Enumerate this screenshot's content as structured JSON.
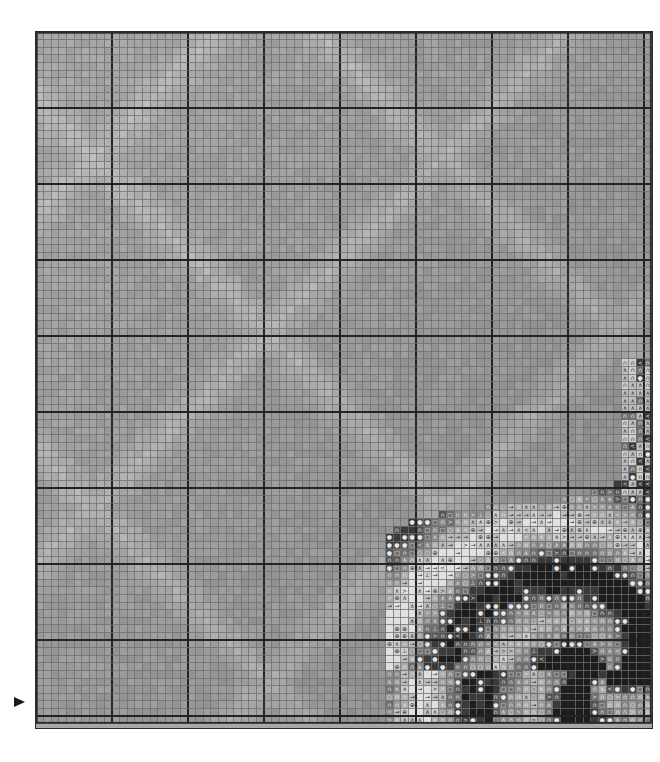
{
  "chart_data": {
    "type": "heatmap",
    "grid": {
      "columns": 81,
      "rows": 91,
      "cell_px": 7.6,
      "bold_every": 10
    },
    "xlabel": "",
    "ylabel": "",
    "grid_on": true,
    "legend_position": "none",
    "colors": {
      "background": "#a8a8a8",
      "grid_minor": "#6e6e6e",
      "grid_major": "#232323",
      "border": "#2b2b2b",
      "marker": "#1a1a1a",
      "page": "#ffffff"
    },
    "palette": [
      {
        "key": "g0",
        "hex": "#f2f2f2",
        "name": "near-white"
      },
      {
        "key": "g1",
        "hex": "#e0e0e0",
        "name": "light-1"
      },
      {
        "key": "g2",
        "hex": "#cfcfcf",
        "name": "light-2"
      },
      {
        "key": "g3",
        "hex": "#bdbdbd",
        "name": "light-3"
      },
      {
        "key": "g4",
        "hex": "#ababab",
        "name": "mid-1"
      },
      {
        "key": "g5",
        "hex": "#9b9b9b",
        "name": "mid-2"
      },
      {
        "key": "g6",
        "hex": "#8a8a8a",
        "name": "mid-3"
      },
      {
        "key": "g7",
        "hex": "#6f6f6f",
        "name": "dark-1"
      },
      {
        "key": "g8",
        "hex": "#545454",
        "name": "dark-2"
      },
      {
        "key": "g9",
        "hex": "#3a3a3a",
        "name": "dark-3"
      },
      {
        "key": "ga",
        "hex": "#1d1d1d",
        "name": "near-black"
      }
    ],
    "symbols": [
      {
        "key": "n",
        "glyph": "∩",
        "name": "arch"
      },
      {
        "key": "a",
        "glyph": "∧",
        "name": "caret"
      },
      {
        "key": "o",
        "glyph": "○",
        "name": "circle"
      },
      {
        "key": "q",
        "glyph": "□",
        "name": "square"
      },
      {
        "key": "d",
        "glyph": "●",
        "name": "filled-circle"
      },
      {
        "key": "g",
        "glyph": ">",
        "name": "greater-than"
      },
      {
        "key": "l",
        "glyph": "<",
        "name": "less-than"
      },
      {
        "key": "r",
        "glyph": "→",
        "name": "right-arrow"
      },
      {
        "key": "p",
        "glyph": "⊕",
        "name": "circled-plus"
      },
      {
        "key": "t",
        "glyph": "⊥",
        "name": "up-tack"
      }
    ],
    "center_marker": {
      "edge": "left",
      "row": 88,
      "glyph": "▶",
      "name": "row-center-marker"
    },
    "symbol_region": {
      "note": "Symbols occupy the lower-right quadrant and a small strip at the upper right edge.",
      "col_start": 52,
      "col_end": 81,
      "row_start": 43,
      "row_end": 91
    },
    "background_motif": {
      "type": "diamond-lattice",
      "description": "Faint lighter diagonal bands forming an X / diamond lattice across the shaded field",
      "color": "#b9b9b9"
    }
  },
  "meta": {
    "document_kind": "cross-stitch pattern chart page",
    "orientation": "portrait"
  }
}
